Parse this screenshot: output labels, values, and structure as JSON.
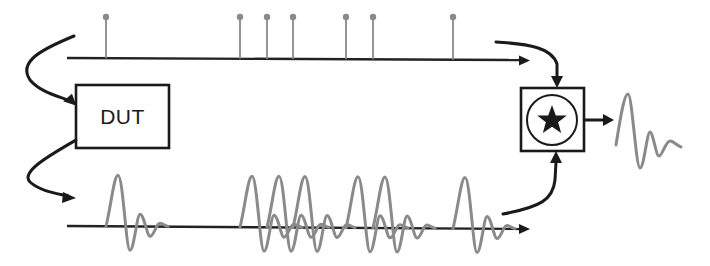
{
  "diagram": {
    "dut_box": {
      "label": "DUT"
    },
    "correlator_box": {
      "symbol": "star-icon",
      "meaning": "cross-correlation operator"
    },
    "input_sequence": {
      "description": "Sparse impulse train (stems with dots) on a time axis",
      "stem_positions_px": [
        106,
        240,
        267,
        293,
        346,
        373,
        453
      ]
    },
    "output_sequence": {
      "description": "Superposed decaying-oscillation responses of DUT to each impulse",
      "pulse_count": 7
    },
    "result": {
      "description": "Recovered single impulse response after correlation"
    },
    "colors": {
      "line": "#1a1a1a",
      "signal": "#8a8a8a",
      "background": "#ffffff"
    }
  }
}
